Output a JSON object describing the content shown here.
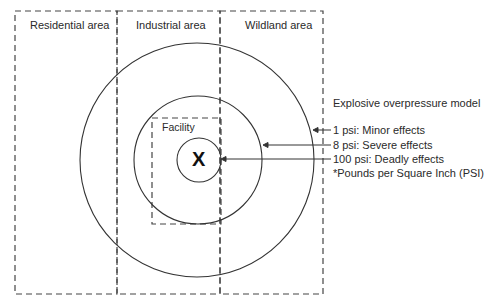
{
  "zones": [
    {
      "label": "Residential area"
    },
    {
      "label": "Industrial area"
    },
    {
      "label": "Wildland area"
    }
  ],
  "facility": {
    "label": "Facility",
    "center_mark": "X"
  },
  "legend": {
    "title": "Explosive overpressure model",
    "items": [
      {
        "label": "1 psi: Minor effects",
        "ring": "outer"
      },
      {
        "label": "8 psi: Severe effects",
        "ring": "middle"
      },
      {
        "label": "100 psi: Deadly effects",
        "ring": "inner"
      }
    ],
    "footnote": "*Pounds per Square Inch (PSI)"
  },
  "colors": {
    "line": "#333333",
    "dash": "#444444"
  }
}
